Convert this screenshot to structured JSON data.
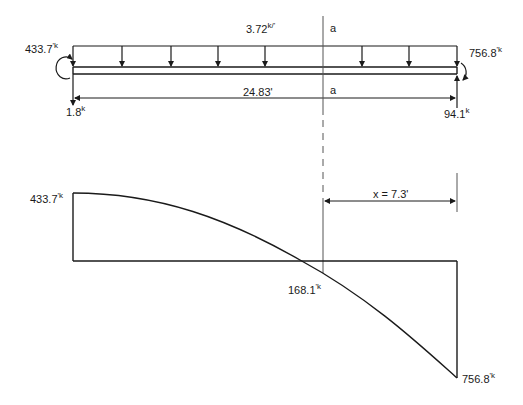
{
  "loading_diagram": {
    "distributed_load": {
      "value": "3.72",
      "unit": "k/'"
    },
    "left_moment": {
      "value": "433.7",
      "unit": "'k"
    },
    "right_moment": {
      "value": "756.8",
      "unit": "'k"
    },
    "left_reaction": {
      "value": "1.8",
      "unit": "k"
    },
    "right_reaction": {
      "value": "94.1",
      "unit": "k"
    },
    "span_length": "24.83'",
    "section_label_top": "a",
    "section_label_bottom": "a"
  },
  "moment_diagram": {
    "left_value": {
      "value": "433.7",
      "unit": "'k"
    },
    "mid_value": {
      "value": "168.1",
      "unit": "'k"
    },
    "right_value": {
      "value": "756.8",
      "unit": "'k"
    },
    "distance_label": "x = 7.3'"
  },
  "colors": {
    "line": "#1a1a1a",
    "background": "#ffffff",
    "section_line": "#555555"
  }
}
